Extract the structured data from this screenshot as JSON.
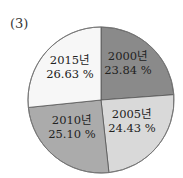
{
  "panel_label": "(3)",
  "chart_data": {
    "type": "pie",
    "title": "",
    "categories": [
      "2000년",
      "2005년",
      "2010년",
      "2015년"
    ],
    "values": [
      23.84,
      24.43,
      25.1,
      26.63
    ],
    "value_labels": [
      "23.84 %",
      "24.43 %",
      "25.10 %",
      "26.63 %"
    ],
    "colors": [
      "#8a8a8a",
      "#d9d9d9",
      "#ababab",
      "#f7f7f7"
    ],
    "start_angle": "12 o'clock",
    "direction": "clockwise",
    "legend": "none (labels inside slices)"
  },
  "slices": [
    {
      "year": "2000년",
      "percent": "23.84 %"
    },
    {
      "year": "2005년",
      "percent": "24.43 %"
    },
    {
      "year": "2010년",
      "percent": "25.10 %"
    },
    {
      "year": "2015년",
      "percent": "26.63 %"
    }
  ]
}
